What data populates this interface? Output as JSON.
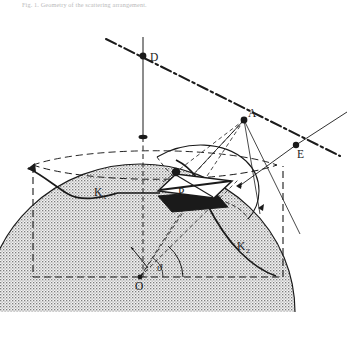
{
  "caption": {
    "text": "Fig.  1.   Geometry of the scattering arrangement."
  },
  "figure": {
    "background_color": "#ffffff",
    "ink_color": "#1a1a1a",
    "dome_fill": "#e8e8e8"
  },
  "labels": {
    "point_d": "D",
    "point_a": "A",
    "point_e": "E",
    "plate_p": "P",
    "curve_k1": "K",
    "curve_k1_sub": "1",
    "curve_k2": "K",
    "curve_k2_sub": "2",
    "origin": "O",
    "angle_theta": "ϑ"
  },
  "geometry": {
    "dome": {
      "center_x": 140,
      "center_y": 277,
      "radius_x": 155,
      "radius_y": 148,
      "equator_ry": 28
    },
    "points": {
      "D": {
        "x": 143,
        "y": 56
      },
      "A": {
        "x": 244,
        "y": 120
      },
      "E": {
        "x": 296,
        "y": 145
      },
      "O": {
        "x": 140,
        "y": 277
      },
      "P": {
        "x": 192,
        "y": 195
      }
    },
    "axis_vertical": {
      "x": 143,
      "y_top": 37,
      "y_bottom": 280
    },
    "dashdot_line": {
      "x1": 108,
      "y1": 40,
      "x2": 337,
      "y2": 155
    }
  }
}
